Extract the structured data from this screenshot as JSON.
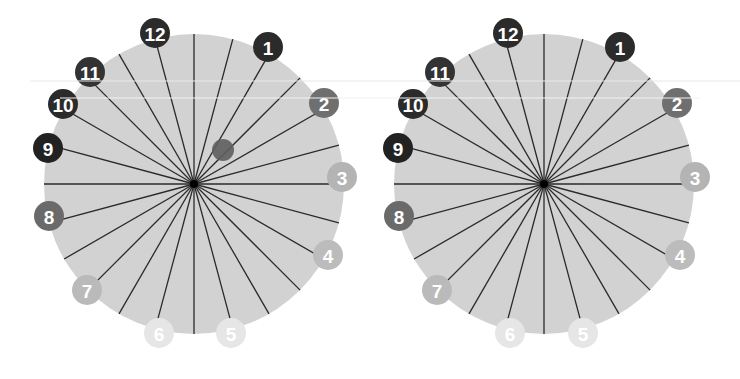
{
  "colors": {
    "background": "#ffffff",
    "disc": "#d2d2d2",
    "spoke": "#2a2a2a",
    "hub": "#000000",
    "marker": "#5e5e5e",
    "badge_text": "#ffffff"
  },
  "wheels": [
    {
      "id": "left",
      "center": [
        194,
        184
      ],
      "radius": 150,
      "spoke_count": 24,
      "marker": {
        "present": true,
        "x": 223,
        "y": 150,
        "r": 11
      },
      "badges": [
        {
          "label": "12",
          "x": 155,
          "y": 33,
          "color": "#2b2b2b"
        },
        {
          "label": "1",
          "x": 268,
          "y": 47,
          "color": "#2b2b2b"
        },
        {
          "label": "2",
          "x": 324,
          "y": 103,
          "color": "#6f6f6f"
        },
        {
          "label": "3",
          "x": 342,
          "y": 177,
          "color": "#b4b4b4"
        },
        {
          "label": "4",
          "x": 328,
          "y": 255,
          "color": "#bcbcbc"
        },
        {
          "label": "5",
          "x": 231,
          "y": 333,
          "color": "#e6e6e6"
        },
        {
          "label": "6",
          "x": 159,
          "y": 333,
          "color": "#e6e6e6"
        },
        {
          "label": "7",
          "x": 87,
          "y": 290,
          "color": "#bababa"
        },
        {
          "label": "8",
          "x": 49,
          "y": 216,
          "color": "#6a6a6a"
        },
        {
          "label": "9",
          "x": 48,
          "y": 148,
          "color": "#222222"
        },
        {
          "label": "10",
          "x": 63,
          "y": 104,
          "color": "#2b2b2b"
        },
        {
          "label": "11",
          "x": 90,
          "y": 72,
          "color": "#333333"
        }
      ]
    },
    {
      "id": "right",
      "center": [
        544,
        184
      ],
      "radius": 150,
      "spoke_count": 24,
      "marker": {
        "present": false
      },
      "badges": [
        {
          "label": "12",
          "x": 508,
          "y": 33,
          "color": "#2b2b2b"
        },
        {
          "label": "1",
          "x": 620,
          "y": 47,
          "color": "#2b2b2b"
        },
        {
          "label": "2",
          "x": 677,
          "y": 103,
          "color": "#6f6f6f"
        },
        {
          "label": "3",
          "x": 695,
          "y": 177,
          "color": "#b4b4b4"
        },
        {
          "label": "4",
          "x": 680,
          "y": 255,
          "color": "#bcbcbc"
        },
        {
          "label": "5",
          "x": 583,
          "y": 333,
          "color": "#e6e6e6"
        },
        {
          "label": "6",
          "x": 510,
          "y": 333,
          "color": "#e6e6e6"
        },
        {
          "label": "7",
          "x": 437,
          "y": 290,
          "color": "#bababa"
        },
        {
          "label": "8",
          "x": 399,
          "y": 216,
          "color": "#6a6a6a"
        },
        {
          "label": "9",
          "x": 398,
          "y": 148,
          "color": "#222222"
        },
        {
          "label": "10",
          "x": 413,
          "y": 104,
          "color": "#2b2b2b"
        },
        {
          "label": "11",
          "x": 440,
          "y": 72,
          "color": "#333333"
        }
      ]
    }
  ]
}
